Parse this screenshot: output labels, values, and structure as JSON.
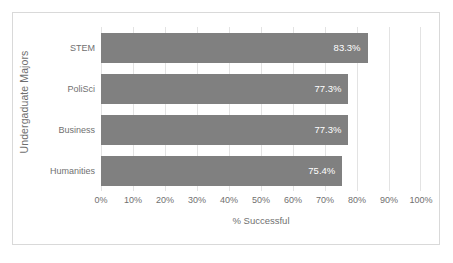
{
  "chart_data": {
    "type": "bar",
    "orientation": "horizontal",
    "title": "",
    "categories": [
      "STEM",
      "PoliSci",
      "Business",
      "Humanities"
    ],
    "values": [
      83.3,
      77.3,
      77.3,
      75.4
    ],
    "data_labels": [
      "83.3%",
      "77.3%",
      "77.3%",
      "75.4%"
    ],
    "xlabel": "% Successful",
    "ylabel": "Undergaduate Majors",
    "xlim": [
      0,
      100
    ],
    "xticks": [
      0,
      10,
      20,
      30,
      40,
      50,
      60,
      70,
      80,
      90,
      100
    ],
    "xticklabels": [
      "0%",
      "10%",
      "20%",
      "30%",
      "40%",
      "50%",
      "60%",
      "70%",
      "80%",
      "90%",
      "100%"
    ],
    "grid": true,
    "grid_axis": "x",
    "legend": false,
    "series_color": "#808080",
    "gridline_color": "#e3e3e3",
    "border_color": "#d9d9d9",
    "label_text_color": "#ffffff",
    "axis_text_color": "#707070"
  }
}
